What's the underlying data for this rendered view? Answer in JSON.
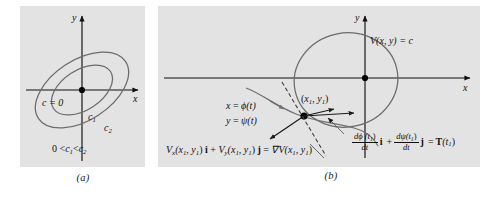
{
  "figure": {
    "type": "math-diagram",
    "background": "#ffffff",
    "panel_fill": "#e3e3e3",
    "curve_color": "#6b6b6b",
    "axis_color": "#111111"
  },
  "panel_a": {
    "caption": "(a)",
    "axis_x_label": "x",
    "axis_y_label": "y",
    "origin_label": "c = 0",
    "level_labels": [
      "c",
      "c"
    ],
    "level_subscripts": [
      "1",
      "2"
    ],
    "inequality": {
      "zero": "0 <",
      "c1": "c",
      "sub1": "1",
      "lt": "<",
      "c2": "c",
      "sub2": "2"
    },
    "description": "Nested tilted ellipses (level curves of V) about the origin"
  },
  "panel_b": {
    "caption": "(b)",
    "axis_x_label": "x",
    "axis_y_label": "y",
    "level_curve_label": "V(x, y) = c",
    "point_label": {
      "open": "(",
      "x": "x",
      "xsub": "1",
      "comma": ", ",
      "y": "y",
      "ysub": "1",
      "close": ")"
    },
    "trajectory": {
      "line1_lhs": "x",
      "line1_eq": " = ",
      "line1_rhs": "ϕ(t)",
      "line2_lhs": "y",
      "line2_eq": " = ",
      "line2_rhs": "ψ(t)"
    },
    "gradient_formula": {
      "v_x": "V",
      "v_x_sub": "x",
      "arg1": "(x",
      "arg1_sub": "1",
      "arg1_mid": ", y",
      "arg1_sub2": "1",
      "arg1_close": ") ",
      "i": "i",
      "plus": " + ",
      "v_y": "V",
      "v_y_sub": "y",
      "arg2": "(x",
      "arg2_sub": "1",
      "arg2_mid": ", y",
      "arg2_sub2": "1",
      "arg2_close": ") ",
      "j": "j",
      "equals": " = ",
      "grad": "∇V(x",
      "grad_sub": "1",
      "grad_mid": ", y",
      "grad_sub2": "1",
      "grad_close": ")"
    },
    "tangent_formula": {
      "frac1_num": "dϕ (t",
      "frac1_num_sub": "1",
      "frac1_num_close": ")",
      "frac1_den": "dt",
      "i": "i",
      "plus": "+",
      "frac2_num": "dψ(t",
      "frac2_num_sub": "1",
      "frac2_num_close": ")",
      "frac2_den": "dt",
      "j": "j",
      "equals": "=",
      "T": "T",
      "T_arg_open": "(t",
      "T_arg_sub": "1",
      "T_arg_close": ")"
    }
  }
}
